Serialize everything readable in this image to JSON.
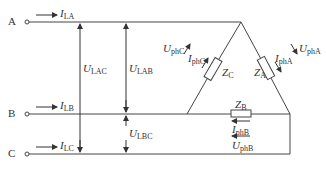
{
  "terminals": [
    {
      "name": "A",
      "y": 22
    },
    {
      "name": "B",
      "y": 114
    },
    {
      "name": "C",
      "y": 154
    }
  ],
  "line_currents": [
    {
      "sym": "I",
      "sub": "LA"
    },
    {
      "sym": "I",
      "sub": "LB"
    },
    {
      "sym": "I",
      "sub": "LC"
    }
  ],
  "line_voltages": [
    {
      "sym": "U",
      "sub": "LAC"
    },
    {
      "sym": "U",
      "sub": "LAB"
    },
    {
      "sym": "U",
      "sub": "LBC"
    }
  ],
  "impedances": [
    {
      "sym": "Z",
      "sub": "A"
    },
    {
      "sym": "Z",
      "sub": "B"
    },
    {
      "sym": "Z",
      "sub": "C"
    }
  ],
  "phase_currents": [
    {
      "sym": "I",
      "sub": "phA"
    },
    {
      "sym": "I",
      "sub": "phB"
    },
    {
      "sym": "I",
      "sub": "phC"
    }
  ],
  "phase_voltages": [
    {
      "sym": "U",
      "sub": "phA"
    },
    {
      "sym": "U",
      "sub": "phB"
    },
    {
      "sym": "U",
      "sub": "phC"
    }
  ],
  "colors": {
    "stroke": "#444444",
    "text": "#333333"
  }
}
